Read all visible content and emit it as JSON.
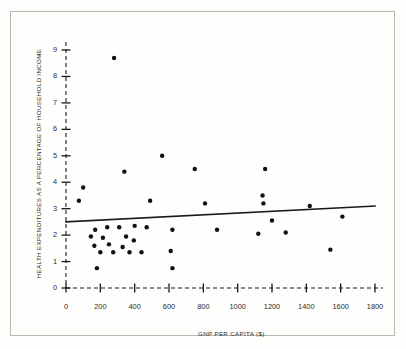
{
  "chart_data": {
    "type": "scatter",
    "title": "",
    "xlabel": "GNP PER CAPITA ($)",
    "ylabel": "HEALTH EXPENDITURES AS A PERCENTAGE OF HOUSEHOLD INCOME",
    "xlim": [
      0,
      1800
    ],
    "ylim": [
      0,
      9
    ],
    "xticks": [
      0,
      200,
      400,
      600,
      800,
      1000,
      1200,
      1400,
      1600,
      1800
    ],
    "yticks": [
      0,
      1,
      2,
      3,
      4,
      5,
      6,
      7,
      8,
      9
    ],
    "xtick_labels": [
      "0",
      "200",
      "400",
      "600",
      "800",
      "1000",
      "1200",
      "1400",
      "1600",
      "1800"
    ],
    "ytick_labels": [
      "0",
      "1",
      "2",
      "3",
      "4",
      "5",
      "6",
      "7",
      "8",
      "9"
    ],
    "grid": false,
    "legend": null,
    "axis_style": "dashed-with-plus-ticks",
    "marker": "filled-circle",
    "marker_color": "#111111",
    "points": [
      {
        "x": 280,
        "y": 8.7
      },
      {
        "x": 560,
        "y": 5.0
      },
      {
        "x": 340,
        "y": 4.4
      },
      {
        "x": 750,
        "y": 4.5
      },
      {
        "x": 1160,
        "y": 4.5
      },
      {
        "x": 100,
        "y": 3.8
      },
      {
        "x": 75,
        "y": 3.3
      },
      {
        "x": 490,
        "y": 3.3
      },
      {
        "x": 810,
        "y": 3.2
      },
      {
        "x": 1145,
        "y": 3.5
      },
      {
        "x": 1150,
        "y": 3.2
      },
      {
        "x": 1420,
        "y": 3.1
      },
      {
        "x": 1200,
        "y": 2.55
      },
      {
        "x": 1610,
        "y": 2.7
      },
      {
        "x": 170,
        "y": 2.2
      },
      {
        "x": 240,
        "y": 2.3
      },
      {
        "x": 310,
        "y": 2.3
      },
      {
        "x": 400,
        "y": 2.35
      },
      {
        "x": 470,
        "y": 2.3
      },
      {
        "x": 620,
        "y": 2.2
      },
      {
        "x": 880,
        "y": 2.2
      },
      {
        "x": 1120,
        "y": 2.05
      },
      {
        "x": 1280,
        "y": 2.1
      },
      {
        "x": 145,
        "y": 1.95
      },
      {
        "x": 215,
        "y": 1.9
      },
      {
        "x": 350,
        "y": 1.95
      },
      {
        "x": 395,
        "y": 1.8
      },
      {
        "x": 165,
        "y": 1.6
      },
      {
        "x": 250,
        "y": 1.65
      },
      {
        "x": 330,
        "y": 1.55
      },
      {
        "x": 200,
        "y": 1.35
      },
      {
        "x": 275,
        "y": 1.35
      },
      {
        "x": 370,
        "y": 1.35
      },
      {
        "x": 440,
        "y": 1.35
      },
      {
        "x": 610,
        "y": 1.4
      },
      {
        "x": 1540,
        "y": 1.45
      },
      {
        "x": 180,
        "y": 0.75
      },
      {
        "x": 620,
        "y": 0.75
      }
    ],
    "trend_line": {
      "type": "linear-fit",
      "x_start": 0,
      "y_start": 2.5,
      "x_end": 1800,
      "y_end": 3.1,
      "color": "#1a1a1a"
    }
  }
}
